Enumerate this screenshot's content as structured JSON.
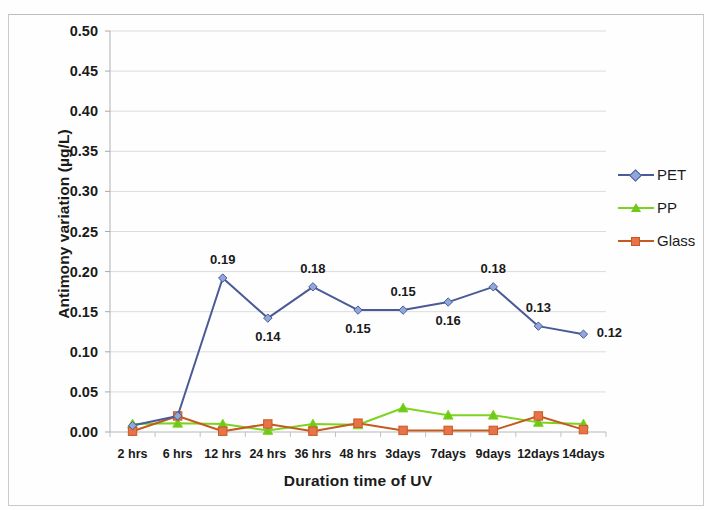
{
  "chart_data": {
    "type": "line",
    "title": "",
    "xlabel": "Duration time of UV",
    "ylabel": "Antimony variation (µg/L)",
    "categories": [
      "2 hrs",
      "6 hrs",
      "12 hrs",
      "24 hrs",
      "36 hrs",
      "48 hrs",
      "3days",
      "7days",
      "9days",
      "12days",
      "14days"
    ],
    "ylim": [
      0.0,
      0.5
    ],
    "ytick_labels": [
      "0.00",
      "0.05",
      "0.10",
      "0.15",
      "0.20",
      "0.25",
      "0.30",
      "0.35",
      "0.40",
      "0.45",
      "0.50"
    ],
    "ytick_values": [
      0.0,
      0.05,
      0.1,
      0.15,
      0.2,
      0.25,
      0.3,
      0.35,
      0.4,
      0.45,
      0.5
    ],
    "grid": "horizontal",
    "legend_position": "right",
    "series": [
      {
        "name": "PET",
        "color": "#4a5a96",
        "marker_color": "#8fa8dc",
        "marker": "diamond",
        "values": [
          0.008,
          0.02,
          0.192,
          0.142,
          0.181,
          0.152,
          0.152,
          0.162,
          0.181,
          0.132,
          0.122
        ],
        "labels": [
          "",
          "",
          "0.19",
          "0.14",
          "0.18",
          "0.15",
          "0.15",
          "0.16",
          "0.18",
          "0.13",
          "0.12"
        ],
        "label_positions": [
          "",
          "",
          "above",
          "below",
          "above",
          "below",
          "above",
          "below",
          "above",
          "above",
          "right"
        ]
      },
      {
        "name": "PP",
        "color": "#7ed321",
        "marker_color": "#6fc91a",
        "marker": "triangle",
        "values": [
          0.01,
          0.011,
          0.01,
          0.002,
          0.01,
          0.009,
          0.03,
          0.021,
          0.021,
          0.012,
          0.01
        ]
      },
      {
        "name": "Glass",
        "color": "#c55a20",
        "marker_color": "#e8734a",
        "marker": "square",
        "values": [
          0.001,
          0.02,
          0.001,
          0.01,
          0.001,
          0.011,
          0.002,
          0.002,
          0.002,
          0.02,
          0.003
        ]
      }
    ]
  },
  "legend": {
    "items": [
      {
        "label": "PET"
      },
      {
        "label": "PP"
      },
      {
        "label": "Glass"
      }
    ]
  },
  "axes": {
    "x_title": "Duration time of UV",
    "y_title": "Antimony variation (µg/L)"
  }
}
